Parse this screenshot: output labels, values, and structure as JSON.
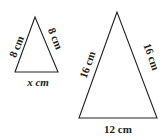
{
  "diagram": {
    "small_triangle": {
      "left_side": "8 cm",
      "right_side": "8 cm",
      "base": "x cm"
    },
    "large_triangle": {
      "left_side": "16 cm",
      "right_side": "16 cm",
      "base": "12 cm"
    },
    "colors": {
      "line": "#222222",
      "background": "#ffffff"
    }
  }
}
